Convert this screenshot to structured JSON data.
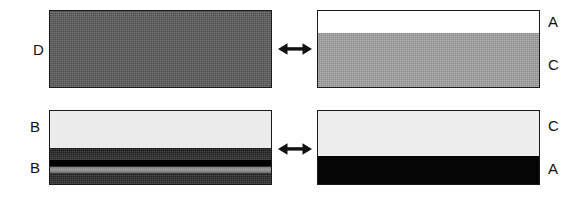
{
  "figure": {
    "background_color": "#ffffff",
    "outline_color": "#1a1a1a"
  },
  "panels": [
    {
      "id": "top-left",
      "position": {
        "x": 49,
        "y": 10,
        "width": 223,
        "height": 78
      },
      "side": "left",
      "label_side": "left",
      "labels": [
        {
          "text": "D",
          "x": 33,
          "y": 42,
          "layer_index": 0
        }
      ],
      "layers": [
        {
          "name": "D",
          "color": "#5d5d5d",
          "height_pct": 100,
          "texture": "dither"
        }
      ]
    },
    {
      "id": "top-right",
      "position": {
        "x": 317,
        "y": 10,
        "width": 223,
        "height": 78
      },
      "side": "right",
      "label_side": "right",
      "labels": [
        {
          "text": "A",
          "x": 548,
          "y": 14,
          "layer_index": 0
        },
        {
          "text": "C",
          "x": 548,
          "y": 57,
          "layer_index": 1
        }
      ],
      "layers": [
        {
          "name": "A",
          "color": "#ffffff",
          "height_pct": 29,
          "texture": "none"
        },
        {
          "name": "C",
          "color": "#a3a3a3",
          "height_pct": 71,
          "texture": "dither"
        }
      ]
    },
    {
      "id": "bottom-left",
      "position": {
        "x": 49,
        "y": 110,
        "width": 223,
        "height": 75
      },
      "side": "left",
      "label_side": "left",
      "labels": [
        {
          "text": "B",
          "x": 30,
          "y": 119,
          "layer_index": 0
        },
        {
          "text": "B",
          "x": 30,
          "y": 160,
          "layer_index": 1
        }
      ],
      "layers": [
        {
          "name": "B",
          "color": "#ececec",
          "height_pct": 51,
          "texture": "none"
        },
        {
          "name": "B",
          "color": "#2a2a2a",
          "height_pct": 49,
          "texture": "dither-banded"
        }
      ]
    },
    {
      "id": "bottom-right",
      "position": {
        "x": 317,
        "y": 110,
        "width": 223,
        "height": 75
      },
      "side": "right",
      "label_side": "right",
      "labels": [
        {
          "text": "C",
          "x": 548,
          "y": 118,
          "layer_index": 0
        },
        {
          "text": "A",
          "x": 548,
          "y": 161,
          "layer_index": 1
        }
      ],
      "layers": [
        {
          "name": "C",
          "color": "#ededed",
          "height_pct": 61,
          "texture": "none"
        },
        {
          "name": "A",
          "color": "#050505",
          "height_pct": 39,
          "texture": "none"
        }
      ]
    }
  ],
  "arrows": [
    {
      "id": "top-arrow",
      "type": "double-headed-horizontal",
      "glyph": "left-right-arrow",
      "x": 278,
      "y": 41,
      "width": 34,
      "height": 16,
      "color": "#111111"
    },
    {
      "id": "bottom-arrow",
      "type": "double-headed-horizontal",
      "glyph": "left-right-arrow",
      "x": 278,
      "y": 141,
      "width": 34,
      "height": 16,
      "color": "#111111"
    }
  ]
}
